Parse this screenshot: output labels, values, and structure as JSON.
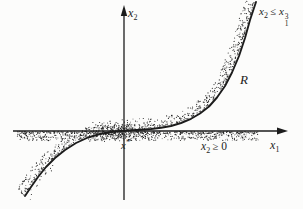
{
  "figure": {
    "background": "#fcfcfb",
    "ink": "#1c1c1c",
    "stipple_dark": "#262626",
    "stipple_light": "#6e6e6e"
  },
  "axis_labels": {
    "x": {
      "base": "x",
      "sub": "1"
    },
    "y": {
      "base": "x",
      "sub": "2"
    }
  },
  "annotations": {
    "curve_constraint": {
      "lhs_base": "x",
      "lhs_sub": "2",
      "op": "≤",
      "rhs_base": "x",
      "rhs_sup": "3",
      "rhs_sub": "1"
    },
    "halfplane_constraint": {
      "lhs_base": "x",
      "lhs_sub": "2",
      "op": "≥",
      "rhs": "0"
    },
    "region_label": "R",
    "point_label": {
      "base": "x",
      "sup": "*"
    }
  },
  "icons": {
    "x_axis_arrow": "arrow-right-icon",
    "y_axis_arrow": "arrow-up-icon"
  },
  "curve": {
    "description": "boundary curve of region R",
    "points": [
      [
        25,
        196
      ],
      [
        31,
        187
      ],
      [
        38,
        177
      ],
      [
        46,
        167
      ],
      [
        55,
        158
      ],
      [
        65,
        150
      ],
      [
        76,
        143
      ],
      [
        88,
        137.5
      ],
      [
        100,
        134
      ],
      [
        111,
        132
      ],
      [
        118,
        131.3
      ],
      [
        124,
        130.8
      ],
      [
        132,
        130.3
      ],
      [
        141,
        129.8
      ],
      [
        151,
        129
      ],
      [
        161,
        127.8
      ],
      [
        171,
        126
      ],
      [
        181,
        123
      ],
      [
        191,
        118.8
      ],
      [
        200,
        113.5
      ],
      [
        209,
        106.5
      ],
      [
        217,
        97.5
      ],
      [
        225,
        86
      ],
      [
        232,
        72.5
      ],
      [
        239,
        56
      ],
      [
        245,
        38
      ],
      [
        250,
        20
      ],
      [
        254,
        8
      ],
      [
        256,
        2
      ]
    ]
  }
}
